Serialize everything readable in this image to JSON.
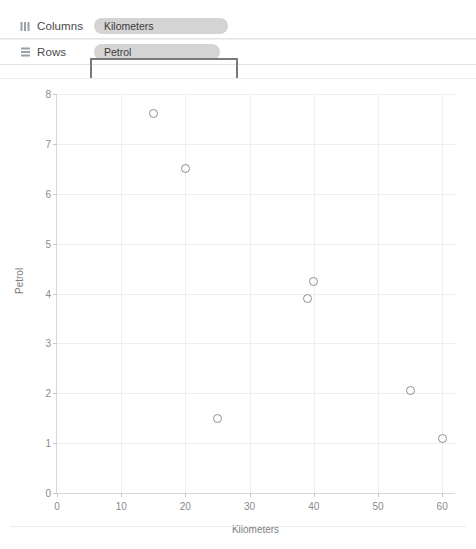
{
  "shelves": [
    {
      "name": "columns",
      "label": "Columns",
      "icon": "columns-icon",
      "pill": "Kilometers",
      "selected": false
    },
    {
      "name": "rows",
      "label": "Rows",
      "icon": "rows-icon",
      "pill": "Petrol",
      "selected": true
    }
  ],
  "colors": {
    "pill_background": "#d4d4d4",
    "pill_text": "#3b3b3b",
    "selection_border": "#7a7a7a",
    "marker_stroke": "#8e8e8e",
    "gridline": "#efefef",
    "axis_line": "#d8d8d8",
    "tick_text": "#8a8a8a"
  },
  "chart_data": {
    "type": "scatter",
    "title": "",
    "xlabel": "Kilometers",
    "ylabel": "Petrol",
    "xlim": [
      0,
      62
    ],
    "ylim": [
      0,
      8
    ],
    "xticks": [
      0,
      10,
      20,
      30,
      40,
      50,
      60
    ],
    "yticks": [
      0,
      1,
      2,
      3,
      4,
      5,
      6,
      7,
      8
    ],
    "grid": true,
    "legend": "none",
    "marker": "open-circle",
    "points": [
      {
        "x": 15,
        "y": 7.6
      },
      {
        "x": 20,
        "y": 6.5
      },
      {
        "x": 25,
        "y": 1.5
      },
      {
        "x": 39,
        "y": 3.9
      },
      {
        "x": 40,
        "y": 4.25
      },
      {
        "x": 55,
        "y": 2.05
      },
      {
        "x": 60,
        "y": 1.1
      }
    ]
  }
}
